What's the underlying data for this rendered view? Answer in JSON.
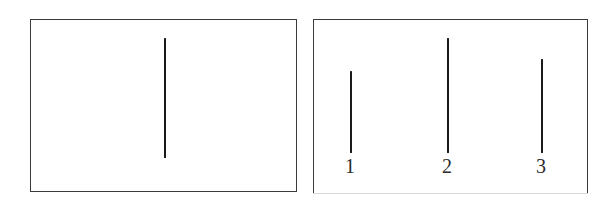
{
  "figure": {
    "name": "two-panel-line-length-comparison",
    "background_color": "#ffffff",
    "ink_color": "#1a1a1a",
    "border_color": "#3b3b3b",
    "panels": [
      {
        "id": "standard",
        "name": "standard-panel",
        "caption": "",
        "lines": [
          {
            "id": "standard-line",
            "label": "",
            "x": 164,
            "y_top": 37,
            "y_bottom": 157,
            "length_px": 120
          }
        ]
      },
      {
        "id": "comparison",
        "name": "comparison-panel",
        "caption": "",
        "lines": [
          {
            "id": "comparison-line-1",
            "label": "1",
            "x": 350,
            "y_top": 70,
            "y_bottom": 152,
            "length_px": 82
          },
          {
            "id": "comparison-line-2",
            "label": "2",
            "x": 447,
            "y_top": 37,
            "y_bottom": 152,
            "length_px": 115
          },
          {
            "id": "comparison-line-3",
            "label": "3",
            "x": 541,
            "y_top": 58,
            "y_bottom": 152,
            "length_px": 94
          }
        ]
      }
    ],
    "labels": {
      "line_1": "1",
      "line_2": "2",
      "line_3": "3"
    }
  },
  "chart_data": {
    "type": "bar",
    "title": "",
    "subtitle": "",
    "xlabel": "",
    "ylabel": "",
    "orientation": "vertical",
    "grid": false,
    "legend": null,
    "note": "Two bounded panels of vertical line segments; bar heights are the drawn line lengths in pixels.",
    "panels": [
      {
        "name": "standard-panel",
        "categories": [
          ""
        ],
        "values": [
          120
        ]
      },
      {
        "name": "comparison-panel",
        "categories": [
          "1",
          "2",
          "3"
        ],
        "values": [
          82,
          115,
          94
        ]
      }
    ],
    "categories": [
      "standard",
      "1",
      "2",
      "3"
    ],
    "values": [
      120,
      82,
      115,
      94
    ],
    "ylim": [
      0,
      130
    ]
  }
}
